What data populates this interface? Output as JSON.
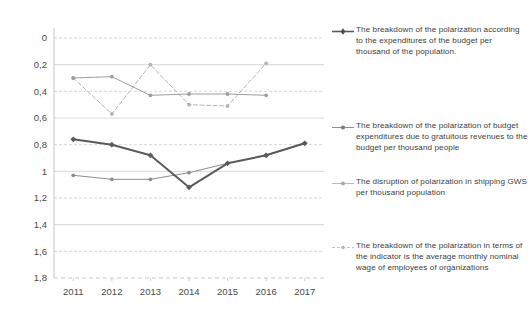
{
  "chart_data": {
    "type": "line",
    "title": "",
    "xlabel": "",
    "ylabel": "",
    "categories": [
      "2011",
      "2012",
      "2013",
      "2014",
      "2015",
      "2016",
      "2017"
    ],
    "ylim": [
      0,
      1.8
    ],
    "ytick_step": 0.2,
    "ytick_labels": [
      "0",
      "0,2",
      "0,4",
      "0,6",
      "0,8",
      "1",
      "1,2",
      "1,4",
      "1,6",
      "1,8"
    ],
    "grid": true,
    "legend_position": "right",
    "decimal_separator": ",",
    "series": [
      {
        "name": "The breakdown of the polarization according to the expenditures of the budget per thousand of the population.",
        "color": "#5a5a5a",
        "style": "solid-thick",
        "marker": "diamond",
        "values": [
          1.04,
          1.0,
          0.92,
          0.68,
          0.86,
          0.92,
          1.01
        ]
      },
      {
        "name": "The breakdown of the polarization of budget expenditures due to gratuitous revenues to the budget per thousand people",
        "color": "#8d8d8d",
        "style": "solid-thin",
        "marker": "dot",
        "values": [
          0.77,
          0.74,
          0.74,
          0.79,
          0.86,
          0.92,
          1.01
        ]
      },
      {
        "name": "The disruption of polarization in shipping GWS per thousand population",
        "color": "#9e9e9e",
        "style": "solid-thin",
        "marker": "dot",
        "values": [
          1.5,
          1.51,
          1.37,
          1.38,
          1.38,
          1.37,
          null
        ]
      },
      {
        "name": "The breakdown of the polarization in terms of the indicator is the average monthly nominal wage of employees of organizations",
        "color": "#b4b4b4",
        "style": "dashed",
        "marker": "dot",
        "values": [
          1.5,
          1.23,
          1.6,
          1.3,
          1.29,
          1.61,
          null
        ]
      }
    ]
  },
  "legend": {
    "items": [
      {
        "label": "The breakdown of the polarization according to the expenditures of the budget per thousand of the population."
      },
      {
        "label": "The breakdown of the polarization of budget expenditures due to gratuitous revenues to the budget per thousand people"
      },
      {
        "label": "The disruption of polarization in shipping GWS per thousand population"
      },
      {
        "label": "The breakdown of the polarization in terms of the indicator is the average monthly nominal wage of employees of organizations"
      }
    ]
  },
  "axis": {
    "y_labels": [
      "1,8",
      "1,6",
      "1,4",
      "1,2",
      "1",
      "0,8",
      "0,6",
      "0,4",
      "0,2",
      "0"
    ],
    "x_labels": [
      "2011",
      "2012",
      "2013",
      "2014",
      "2015",
      "2016",
      "2017"
    ]
  }
}
